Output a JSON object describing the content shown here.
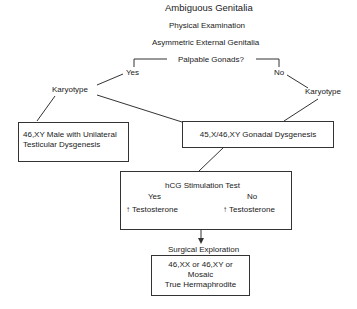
{
  "diagram": {
    "title": "Ambiguous Genitalia",
    "step1": "Physical Examination",
    "step2": "Asymmetric External Genitalia",
    "question": "Palpable Gonads?",
    "yes_label": "Yes",
    "no_label": "No",
    "karyotype_left": "Karyotype",
    "karyotype_right": "Karyotype",
    "box_left_line1": "46,XY Male with Unilateral",
    "box_left_line2": "Testicular Dysgenesis",
    "box_right": "45,X/46,XY Gonadal Dysgenesis",
    "hcg_box": {
      "title": "hCG Stimulation Test",
      "yes": "Yes",
      "no": "No",
      "yes_result": "Testosterone",
      "no_result": "Testosterone",
      "arrow_glyph": "↑"
    },
    "surgical": "Surgical Exploration",
    "final_box_line1": "46,XX or 46,XY or",
    "final_box_line2": "Mosaic",
    "final_box_line3": "True Hermaphrodite"
  }
}
